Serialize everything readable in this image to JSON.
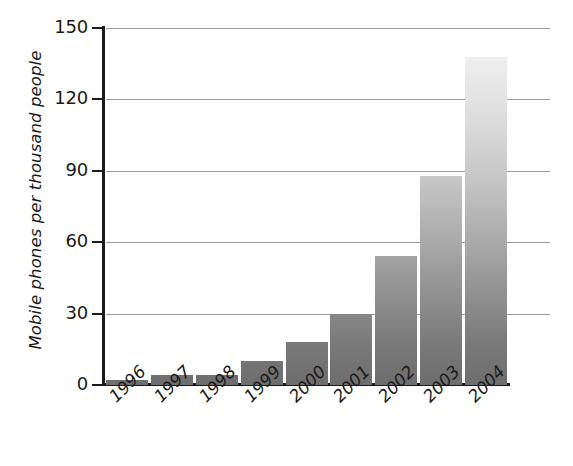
{
  "chart_data": {
    "type": "bar",
    "title": "",
    "subtitle": "",
    "xlabel": "",
    "ylabel": "Mobile phones per thousand people",
    "categories": [
      "1996",
      "1997",
      "1998",
      "1999",
      "2000",
      "2001",
      "2002",
      "2003",
      "2004"
    ],
    "values": [
      2,
      4,
      4,
      10,
      18,
      30,
      54,
      88,
      138
    ],
    "series": [
      {
        "name": "Mobile phones per thousand people",
        "values": [
          2,
          4,
          4,
          10,
          18,
          30,
          54,
          88,
          138
        ]
      }
    ],
    "ylim": [
      0,
      150
    ],
    "ytick_labels": [
      "0",
      "30",
      "60",
      "90",
      "120",
      "150"
    ],
    "ytick_values": [
      0,
      30,
      60,
      90,
      120,
      150
    ],
    "grid": "horizontal",
    "legend": "none",
    "bar_fill": "vertical-gray-gradient",
    "colors": {
      "gradient_top": "#f4f4f4",
      "gradient_bottom": "#6d6d6d",
      "axis": "#1b1b1b",
      "gridline": "#9a9a9a",
      "text": "#1a1a1a",
      "background": "#ffffff"
    }
  },
  "axes": {
    "y": {
      "title": "Mobile phones per thousand people",
      "ticks": [
        {
          "label": "150",
          "value": 150
        },
        {
          "label": "120",
          "value": 120
        },
        {
          "label": "90",
          "value": 90
        },
        {
          "label": "60",
          "value": 60
        },
        {
          "label": "30",
          "value": 30
        },
        {
          "label": "0",
          "value": 0
        }
      ]
    },
    "x": {
      "title": "",
      "ticks": [
        {
          "label": "1996"
        },
        {
          "label": "1997"
        },
        {
          "label": "1998"
        },
        {
          "label": "1999"
        },
        {
          "label": "2000"
        },
        {
          "label": "2001"
        },
        {
          "label": "2002"
        },
        {
          "label": "2003"
        },
        {
          "label": "2004"
        }
      ]
    }
  }
}
